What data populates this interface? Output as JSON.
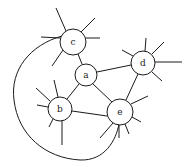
{
  "diagram": {
    "type": "graph",
    "nodes": [
      {
        "id": "a",
        "label": "a",
        "x": 86,
        "y": 75,
        "r": 11
      },
      {
        "id": "b",
        "label": "b",
        "x": 60,
        "y": 109,
        "r": 12
      },
      {
        "id": "c",
        "label": "c",
        "x": 73,
        "y": 42,
        "r": 13
      },
      {
        "id": "d",
        "label": "d",
        "x": 143,
        "y": 63,
        "r": 12
      },
      {
        "id": "e",
        "label": "e",
        "x": 120,
        "y": 112,
        "r": 13
      }
    ],
    "edges": [
      {
        "from": "c",
        "to": "a"
      },
      {
        "from": "a",
        "to": "d"
      },
      {
        "from": "a",
        "to": "b"
      },
      {
        "from": "a",
        "to": "e"
      },
      {
        "from": "b",
        "to": "e"
      },
      {
        "from": "d",
        "to": "e"
      },
      {
        "from": "c",
        "to": "e",
        "curved": true
      }
    ],
    "stroke_color": "#1a1a1a",
    "background": "#ffffff"
  }
}
